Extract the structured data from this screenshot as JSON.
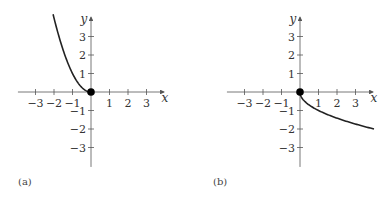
{
  "panels": [
    {
      "id": "a",
      "label": "(a)",
      "origin_px": [
        91,
        92
      ],
      "unit_px": 18.5,
      "x_axis_label": "x",
      "y_axis_label": "y",
      "x_ticks": [
        {
          "v": -3,
          "label": "−3"
        },
        {
          "v": -2,
          "label": "−2"
        },
        {
          "v": -1,
          "label": "−1"
        },
        {
          "v": 1,
          "label": "1"
        },
        {
          "v": 2,
          "label": "2"
        },
        {
          "v": 3,
          "label": "3"
        }
      ],
      "y_ticks": [
        {
          "v": 3,
          "label": "3"
        },
        {
          "v": 2,
          "label": "2"
        },
        {
          "v": 1,
          "label": "1"
        },
        {
          "v": -1,
          "label": "−1"
        },
        {
          "v": -2,
          "label": "−2"
        },
        {
          "v": -3,
          "label": "−3"
        }
      ],
      "curve": "y = x^2, x in [-2.05, 0]",
      "point": [
        0,
        0
      ]
    },
    {
      "id": "b",
      "label": "(b)",
      "origin_px": [
        300,
        92
      ],
      "unit_px": 18.5,
      "x_axis_label": "x",
      "y_axis_label": "y",
      "x_ticks": [
        {
          "v": -3,
          "label": "−3"
        },
        {
          "v": -2,
          "label": "−2"
        },
        {
          "v": -1,
          "label": "−1"
        },
        {
          "v": 1,
          "label": "1"
        },
        {
          "v": 2,
          "label": "2"
        },
        {
          "v": 3,
          "label": "3"
        }
      ],
      "y_ticks": [
        {
          "v": 3,
          "label": "3"
        },
        {
          "v": 2,
          "label": "2"
        },
        {
          "v": 1,
          "label": "1"
        },
        {
          "v": -1,
          "label": "−1"
        },
        {
          "v": -2,
          "label": "−2"
        },
        {
          "v": -3,
          "label": "−3"
        }
      ],
      "curve": "y = -sqrt(x), x in [0, 4]",
      "point": [
        0,
        0
      ]
    }
  ],
  "colors": {
    "axis": "#555555",
    "curve": "#222222",
    "point": "#000000"
  }
}
